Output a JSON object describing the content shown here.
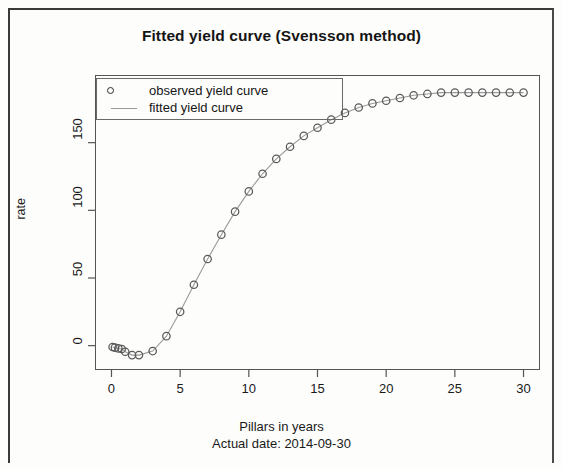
{
  "chart_data": {
    "type": "scatter",
    "title": "Fitted yield curve (Svensson method)",
    "xlabel": "Pillars in years",
    "sublabel": "Actual date: 2014-09-30",
    "ylabel": "rate",
    "xlim": [
      -1.2,
      31.2
    ],
    "ylim": [
      -18,
      200
    ],
    "xticks": [
      0,
      5,
      10,
      15,
      20,
      25,
      30
    ],
    "yticks": [
      0,
      50,
      100,
      150
    ],
    "grid": false,
    "legend_position": "top-left",
    "marker_color": "#4a4a4a",
    "line_color": "#9a9a9a",
    "series": [
      {
        "name": "observed yield curve",
        "marker": "circle",
        "x": [
          0.08,
          0.25,
          0.5,
          0.75,
          1.0,
          1.5,
          2.0,
          3.0,
          4.0,
          5.0,
          6.0,
          7.0,
          8.0,
          9.0,
          10.0,
          11.0,
          12.0,
          13.0,
          14.0,
          15.0,
          16.0,
          17.0,
          18.0,
          19.0,
          20.0,
          21.0,
          22.0,
          23.0,
          24.0,
          25.0,
          26.0,
          27.0,
          28.0,
          29.0,
          30.0
        ],
        "y": [
          -1.0,
          -1.5,
          -2.0,
          -2.5,
          -4.5,
          -7.0,
          -7.0,
          -4.0,
          7.0,
          25.0,
          45.0,
          64.0,
          82.0,
          99.0,
          114.0,
          127.0,
          138.0,
          147.0,
          155.0,
          161.0,
          167.0,
          172.0,
          176.0,
          179.0,
          181.0,
          183.0,
          185.0,
          186.0,
          187.0,
          187.0,
          187.0,
          187.0,
          187.0,
          187.0,
          187.0
        ]
      },
      {
        "name": "fitted yield curve",
        "marker": "line",
        "x": [
          0.08,
          0.25,
          0.5,
          0.75,
          1.0,
          1.5,
          2.0,
          3.0,
          4.0,
          5.0,
          6.0,
          7.0,
          8.0,
          9.0,
          10.0,
          11.0,
          12.0,
          13.0,
          14.0,
          15.0,
          16.0,
          17.0,
          18.0,
          19.0,
          20.0,
          21.0,
          22.0,
          23.0,
          24.0,
          25.0,
          26.0,
          27.0,
          28.0,
          29.0,
          30.0
        ],
        "y": [
          -1.0,
          -1.5,
          -2.0,
          -2.5,
          -4.5,
          -7.0,
          -7.0,
          -4.0,
          7.0,
          25.0,
          45.0,
          64.0,
          82.0,
          99.0,
          114.0,
          127.0,
          138.0,
          147.0,
          155.0,
          161.0,
          167.0,
          172.0,
          176.0,
          179.0,
          181.0,
          183.0,
          185.0,
          186.0,
          187.0,
          187.0,
          187.0,
          187.0,
          187.0,
          187.0,
          187.0
        ]
      }
    ]
  },
  "legend": {
    "items": [
      {
        "label": "observed yield curve",
        "key": "circle"
      },
      {
        "label": "fitted yield curve",
        "key": "line"
      }
    ]
  }
}
